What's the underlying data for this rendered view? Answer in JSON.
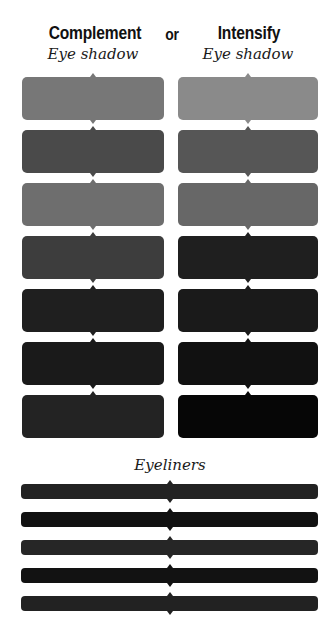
{
  "header": {
    "left_title": "Complement",
    "connector": "or",
    "right_title": "Intensify",
    "left_subtitle": "Eye shadow",
    "right_subtitle": "Eye shadow"
  },
  "eyeshadow": {
    "complement": [
      "#777777",
      "#4a4a4a",
      "#6e6e6e",
      "#3d3d3d",
      "#1f1f1f",
      "#1a1a1a",
      "#232323"
    ],
    "intensify": [
      "#8a8a8a",
      "#565656",
      "#676767",
      "#1f1f1f",
      "#1a1a1a",
      "#111111",
      "#060606"
    ]
  },
  "eyeliners": {
    "title": "Eyeliners",
    "colors": [
      "#222222",
      "#111111",
      "#262626",
      "#121212",
      "#222222"
    ]
  }
}
